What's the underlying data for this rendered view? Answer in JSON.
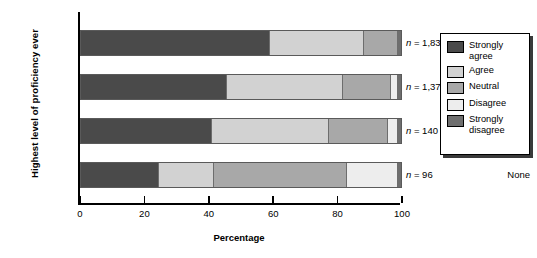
{
  "chart_data": {
    "type": "bar",
    "orientation": "horizontal",
    "stacked": true,
    "title": "",
    "xlabel": "Percentage",
    "ylabel": "Highest level of proficiency ever",
    "xlim": [
      0,
      100
    ],
    "xticks": [
      0,
      20,
      40,
      60,
      80,
      100
    ],
    "grid": false,
    "legend_position": "right",
    "categories": [
      "High",
      "Moderate",
      "Minimal",
      "None"
    ],
    "series": [
      {
        "name": "Strongly agree",
        "color": "#4a4a4a",
        "values": [
          59.0,
          45.5,
          41.0,
          24.5
        ]
      },
      {
        "name": "Agree",
        "color": "#d2d2d2",
        "values": [
          29.5,
          36.5,
          36.5,
          17.0
        ]
      },
      {
        "name": "Neutral",
        "color": "#a8a8a8",
        "values": [
          10.5,
          15.0,
          18.5,
          41.5
        ]
      },
      {
        "name": "Disagree",
        "color": "#ededed",
        "values": [
          0.0,
          2.0,
          3.0,
          16.0
        ]
      },
      {
        "name": "Strongly disagree",
        "color": "#6e6e6e",
        "values": [
          1.0,
          1.0,
          1.0,
          1.0
        ]
      }
    ],
    "annotations": [
      {
        "category": "High",
        "label": "n = 1,830",
        "n_prefix": "n",
        "n_value": "= 1,830"
      },
      {
        "category": "Moderate",
        "label": "n = 1,379",
        "n_prefix": "n",
        "n_value": "= 1,379"
      },
      {
        "category": "Minimal",
        "label": "n = 140",
        "n_prefix": "n",
        "n_value": "= 140"
      },
      {
        "category": "None",
        "label": "n = 96",
        "n_prefix": "n",
        "n_value": "= 96"
      }
    ]
  },
  "axis": {
    "x_title": "Percentage",
    "y_title": "Highest level of proficiency ever",
    "x_tick_labels": [
      "0",
      "20",
      "40",
      "60",
      "80",
      "100"
    ]
  },
  "legend": {
    "items": [
      {
        "label": "Strongly agree",
        "color": "#4a4a4a"
      },
      {
        "label": "Agree",
        "color": "#d2d2d2"
      },
      {
        "label": "Neutral",
        "color": "#a8a8a8"
      },
      {
        "label": "Disagree",
        "color": "#ededed"
      },
      {
        "label": "Strongly disagree",
        "color": "#6e6e6e"
      }
    ]
  }
}
